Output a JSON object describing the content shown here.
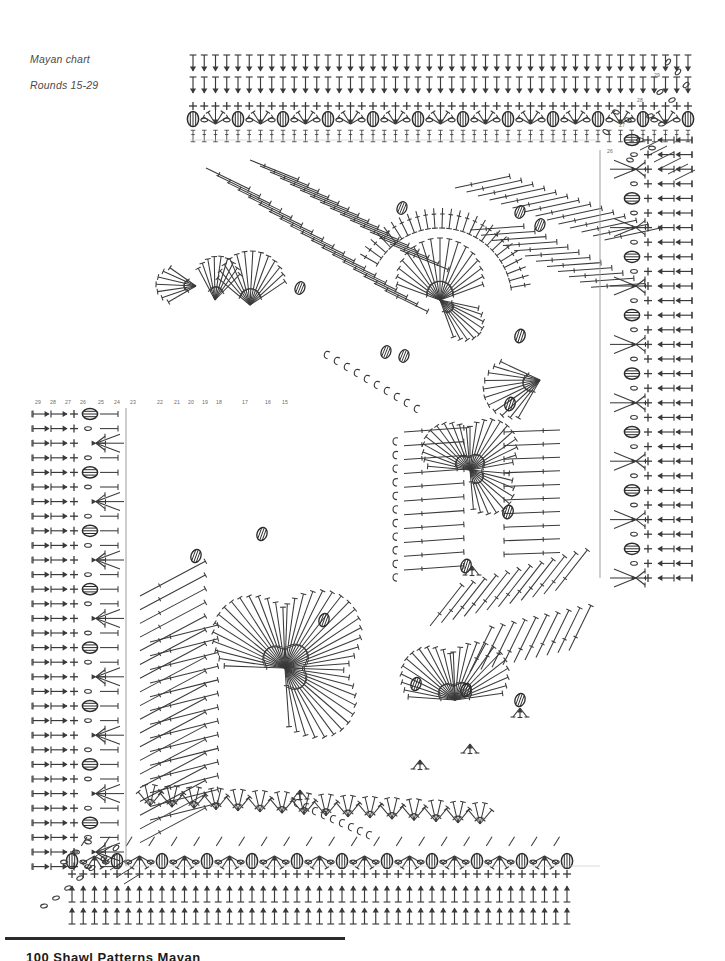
{
  "document": {
    "title": "Mayan chart",
    "subtitle": "Rounds 15-29",
    "caption_line1": "Mayan chart",
    "caption_line2": "Rounds 15-29",
    "footer_text": "100     Shawl Patterns Mayan"
  },
  "chart_data": {
    "type": "diagram",
    "title": "Mayan chart",
    "subtitle": "Rounds 15-29",
    "diagram_kind": "crochet-stitch-chart",
    "shape": "L-shaped / rotated-square corner motif",
    "round_labels_top": [
      "29",
      "28",
      "27",
      "26"
    ],
    "round_labels_left": [
      "29",
      "28",
      "27",
      "26",
      "25",
      "24",
      "23",
      "22",
      "21",
      "20",
      "19",
      "18",
      "17",
      "16",
      "15"
    ],
    "round_label_min": 15,
    "round_label_max": 29,
    "rounds_covered": "15-29",
    "ink_color": "#3a3a3a",
    "background_color": "#ffffff",
    "label_color": "#6b6b6b",
    "caption_color": "#4a4a4a",
    "legend_symbols": [
      {
        "name": "chain",
        "glyph": "0",
        "description": "chain stitch - small oval"
      },
      {
        "name": "single-crochet",
        "glyph": "+",
        "description": "single crochet - plus sign"
      },
      {
        "name": "double-crochet",
        "glyph": "T",
        "description": "double crochet - vertical bar with one cross bar and arrow"
      },
      {
        "name": "treble-crochet",
        "glyph": "T=",
        "description": "treble crochet - vertical bar with two cross bars"
      },
      {
        "name": "bobble",
        "glyph": "O",
        "description": "bobble / popcorn - filled ribbed oval"
      },
      {
        "name": "cluster-decrease",
        "glyph": "Y",
        "description": "cluster decrease - several stitches joined to one point"
      },
      {
        "name": "fan-shell",
        "glyph": "/|\\",
        "description": "fan / shell - radial group of stitches from one point"
      },
      {
        "name": "slip-stitch",
        "glyph": "•",
        "description": "slip stitch - small dot"
      }
    ],
    "regions": [
      {
        "name": "top-band",
        "x": 185,
        "y": 48,
        "width": 510,
        "height": 95,
        "rows": 5,
        "pattern": "double crochet rows with bobble + fan repeats"
      },
      {
        "name": "right-band",
        "x": 595,
        "y": 120,
        "width": 130,
        "height": 460,
        "rows": 15,
        "pattern": "rotated rows: chain, single crochet, arrow stitches, bobbles"
      },
      {
        "name": "left-band",
        "x": 28,
        "y": 412,
        "width": 110,
        "height": 440,
        "rows": 30,
        "pattern": "horizontal rows: arrows, chains, single crochet, bobbles"
      },
      {
        "name": "bottom-band",
        "x": 60,
        "y": 845,
        "width": 540,
        "height": 85,
        "rows": 5,
        "pattern": "double crochet rows with bobble + fan repeats (mirrored)"
      },
      {
        "name": "upper-fan-field",
        "x": 180,
        "y": 140,
        "width": 420,
        "height": 260,
        "pattern": "radial fan clusters and diagonal stitch rays"
      },
      {
        "name": "center-fan-field",
        "x": 350,
        "y": 300,
        "width": 300,
        "height": 290,
        "pattern": "radial fan clusters converging to points"
      },
      {
        "name": "lower-fan-field",
        "x": 120,
        "y": 560,
        "width": 450,
        "height": 300,
        "pattern": "large radial bursts and diagonal stitch rays"
      }
    ]
  }
}
